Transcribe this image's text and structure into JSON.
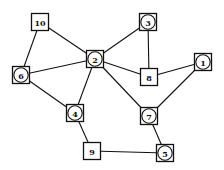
{
  "diagram": {
    "type": "graph",
    "colors": {
      "stroke": "#111111",
      "background": "#ffffff"
    },
    "nodes": [
      {
        "id": "10",
        "label": "10",
        "shape": "square",
        "x": 40,
        "y": 22
      },
      {
        "id": "2",
        "label": "2",
        "shape": "circle-in-square",
        "x": 95,
        "y": 59
      },
      {
        "id": "3",
        "label": "3",
        "shape": "circle-in-square",
        "x": 148,
        "y": 22
      },
      {
        "id": "8",
        "label": "8",
        "shape": "square",
        "x": 149,
        "y": 77
      },
      {
        "id": "1",
        "label": "1",
        "shape": "circle-in-square",
        "x": 203,
        "y": 62
      },
      {
        "id": "6",
        "label": "6",
        "shape": "circle-in-square",
        "x": 21,
        "y": 75
      },
      {
        "id": "4",
        "label": "4",
        "shape": "circle-in-square",
        "x": 75,
        "y": 113
      },
      {
        "id": "7",
        "label": "7",
        "shape": "circle-in-square",
        "x": 149,
        "y": 116
      },
      {
        "id": "9",
        "label": "9",
        "shape": "square",
        "x": 92,
        "y": 151
      },
      {
        "id": "5",
        "label": "5",
        "shape": "circle-in-square",
        "x": 165,
        "y": 153
      }
    ],
    "edges": [
      [
        "10",
        "2"
      ],
      [
        "10",
        "6"
      ],
      [
        "6",
        "2"
      ],
      [
        "6",
        "4"
      ],
      [
        "2",
        "3"
      ],
      [
        "2",
        "8"
      ],
      [
        "2",
        "4"
      ],
      [
        "2",
        "7"
      ],
      [
        "3",
        "8"
      ],
      [
        "8",
        "1"
      ],
      [
        "1",
        "7"
      ],
      [
        "4",
        "9"
      ],
      [
        "9",
        "5"
      ],
      [
        "7",
        "5"
      ]
    ]
  }
}
